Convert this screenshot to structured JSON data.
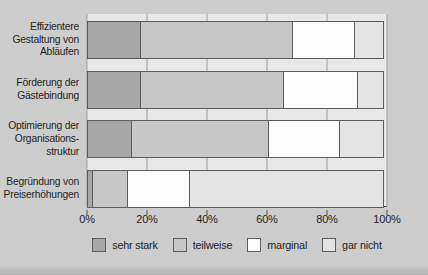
{
  "chart_data": {
    "type": "bar",
    "orientation": "horizontal",
    "stacked": true,
    "title": "",
    "xlabel": "",
    "ylabel": "",
    "xlim": [
      0,
      100
    ],
    "grid": true,
    "legend_position": "bottom",
    "x_ticks": [
      "0%",
      "20%",
      "40%",
      "60%",
      "80%",
      "100%"
    ],
    "categories": [
      [
        "Effizientere",
        "Gestaltung von",
        "Abläufen"
      ],
      [
        "Förderung der",
        "Gästebindung"
      ],
      [
        "Optimierung der",
        "Organisations-",
        "struktur"
      ],
      [
        "Begründung von",
        "Preiserhöhungen"
      ]
    ],
    "series": [
      {
        "name": "sehr stark",
        "color": "#a8a8a8",
        "values": [
          18,
          18,
          15,
          2
        ]
      },
      {
        "name": "teilweise",
        "color": "#c7c7c7",
        "values": [
          51,
          48,
          46,
          12
        ]
      },
      {
        "name": "marginal",
        "color": "#fcfcfc",
        "values": [
          21,
          25,
          24,
          21
        ]
      },
      {
        "name": "gar nicht",
        "color": "#e4e4e4",
        "values": [
          10,
          9,
          15,
          65
        ]
      }
    ]
  },
  "colors": {
    "page_background": "#cdcdcd",
    "plot_background": "#e8e8e8",
    "axis_line": "#4e4e4e",
    "gridline": "#9e9e9e",
    "segment_border": "#5c5c5c",
    "text": "#1f1f1f"
  }
}
